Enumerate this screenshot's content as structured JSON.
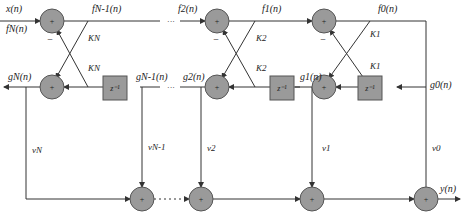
{
  "diagram": {
    "type": "lattice-ladder filter structure",
    "signals": {
      "input_x": "x(n)",
      "input_f": "fN(n)",
      "f_n_minus_1": "fN-1(n)",
      "f2": "f2(n)",
      "f1": "f1(n)",
      "f0": "f0(n)",
      "gN": "gN(n)",
      "g_n_minus_1": "gN-1(n)",
      "g2": "g2(n)",
      "g1": "g1(n)",
      "g0": "g0(n)",
      "output": "y(n)"
    },
    "coefficients": {
      "kN_top": "KN",
      "kN_bot": "KN",
      "k2_top": "K2",
      "k2_bot": "K2",
      "k1_top": "K1",
      "k1_bot": "K1"
    },
    "ladder": {
      "vN": "vN",
      "vN1": "vN-1",
      "v2": "v2",
      "v1": "v1",
      "v0": "v0"
    },
    "delay_label": "z⁻¹",
    "adder_symbol": "+",
    "minus_sign": "−",
    "ellipsis": "···",
    "colors": {
      "node_fill": "#9a9a9a",
      "stroke": "#333333",
      "delay_fill": "#9a9a9a"
    }
  }
}
